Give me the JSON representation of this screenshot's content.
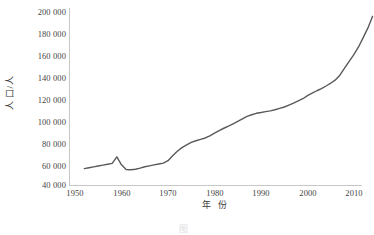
{
  "chart_data": {
    "type": "line",
    "title": "",
    "xlabel": "年 份",
    "ylabel": "人 口/人",
    "xlim": [
      1950,
      2015
    ],
    "ylim": [
      40000,
      200000
    ],
    "xticks": [
      1950,
      1960,
      1970,
      1980,
      1990,
      2000,
      2010
    ],
    "xticklabels": [
      "1950",
      "1960",
      "1970",
      "1980",
      "1990",
      "2000",
      "2010"
    ],
    "yticks": [
      40000,
      60000,
      80000,
      100000,
      120000,
      140000,
      160000,
      180000,
      200000
    ],
    "yticklabels": [
      "40 000",
      "60 000",
      "80 000",
      "100 000",
      "120 000",
      "140 000",
      "160 000",
      "180 000",
      "200 000"
    ],
    "grid": false,
    "legend": null,
    "line_color": "#5a5a5a",
    "series": [
      {
        "name": "人口",
        "x": [
          1952,
          1953,
          1954,
          1955,
          1956,
          1957,
          1958,
          1959,
          1960,
          1961,
          1962,
          1963,
          1964,
          1965,
          1966,
          1967,
          1968,
          1969,
          1970,
          1971,
          1972,
          1973,
          1974,
          1975,
          1976,
          1977,
          1978,
          1979,
          1980,
          1981,
          1982,
          1983,
          1984,
          1985,
          1986,
          1987,
          1988,
          1989,
          1990,
          1991,
          1992,
          1993,
          1994,
          1995,
          1996,
          1997,
          1998,
          1999,
          2000,
          2001,
          2002,
          2003,
          2004,
          2005,
          2006,
          2007,
          2008,
          2009,
          2010,
          2011,
          2012,
          2013,
          2014
        ],
        "values": [
          54800,
          55600,
          56400,
          57200,
          58000,
          58700,
          59500,
          65500,
          58200,
          54000,
          53800,
          54200,
          55200,
          56500,
          57300,
          58200,
          59000,
          59800,
          62000,
          66500,
          70500,
          73800,
          76200,
          78500,
          80000,
          81200,
          82500,
          84500,
          86800,
          89200,
          91300,
          93200,
          95300,
          97500,
          99800,
          102000,
          103500,
          104800,
          105500,
          106300,
          107000,
          108000,
          109200,
          110500,
          112200,
          114000,
          116000,
          118000,
          120800,
          123000,
          125200,
          127200,
          129500,
          132000,
          135000,
          139500,
          145800,
          152000,
          158000,
          165000,
          173500,
          182000,
          192500
        ],
        "final_value_approx": 195000,
        "start_value_approx": 55000,
        "notes": "城镇人口随年份增长曲线；1958—1961 年出现波动与回落"
      }
    ]
  },
  "caption": {
    "text": "图"
  }
}
